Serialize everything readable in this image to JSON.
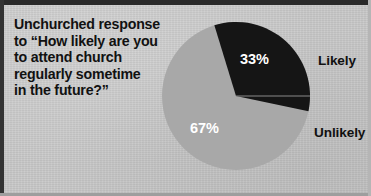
{
  "figure": {
    "background_color": "#c9c9c9",
    "caption": "Unchurched response\nto “How likely are you\nto attend church\nregularly sometime\nin the future?”"
  },
  "chart_data": {
    "type": "pie",
    "title": "Unchurched response to “How likely are you to attend church regularly sometime in the future?”",
    "categories": [
      "Likely",
      "Unlikely"
    ],
    "values": [
      33,
      67
    ],
    "value_labels": [
      "33%",
      "67%"
    ],
    "units": "percent",
    "colors": [
      "#151515",
      "#a8a8a8"
    ],
    "legend": {
      "position": "right",
      "entries": [
        {
          "label": "Likely",
          "value_label": "33%",
          "color": "#151515"
        },
        {
          "label": "Unlikely",
          "value_label": "67%",
          "color": "#a8a8a8"
        }
      ]
    },
    "start_angle_deg": -17,
    "grid": false,
    "xlabel": "",
    "ylabel": ""
  }
}
